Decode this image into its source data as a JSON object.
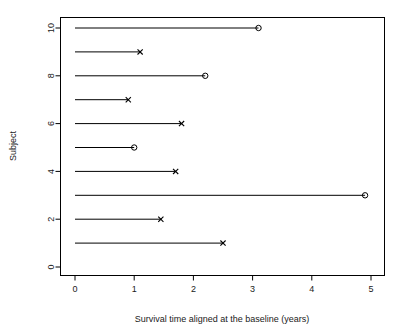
{
  "chart_data": {
    "type": "scatter",
    "title": "",
    "subtitle": "",
    "xlabel": "Survival time aligned at the baseline (years)",
    "ylabel": "Subject",
    "xlim": [
      0,
      5.2
    ],
    "ylim": [
      0,
      10.4
    ],
    "grid": false,
    "legend": null,
    "xticks": [
      "0",
      "1",
      "2",
      "3",
      "4",
      "5"
    ],
    "xtick_values": [
      0,
      1,
      2,
      3,
      4,
      5
    ],
    "yticks": [
      "0",
      "2",
      "4",
      "6",
      "8",
      "10"
    ],
    "ytick_values": [
      0,
      2,
      4,
      6,
      8,
      10
    ],
    "marker_semantics": {
      "circle": "censored",
      "x": "event"
    },
    "series": [
      {
        "name": "survival-segments",
        "points": [
          {
            "subject": 10,
            "start": 0,
            "time": 3.1,
            "marker": "circle",
            "status": "censored"
          },
          {
            "subject": 9,
            "start": 0,
            "time": 1.1,
            "marker": "x",
            "status": "event"
          },
          {
            "subject": 8,
            "start": 0,
            "time": 2.2,
            "marker": "circle",
            "status": "censored"
          },
          {
            "subject": 7,
            "start": 0,
            "time": 0.9,
            "marker": "x",
            "status": "event"
          },
          {
            "subject": 6,
            "start": 0,
            "time": 1.8,
            "marker": "x",
            "status": "event"
          },
          {
            "subject": 5,
            "start": 0,
            "time": 1.0,
            "marker": "circle",
            "status": "censored"
          },
          {
            "subject": 4,
            "start": 0,
            "time": 1.7,
            "marker": "x",
            "status": "event"
          },
          {
            "subject": 3,
            "start": 0,
            "time": 4.9,
            "marker": "circle",
            "status": "censored"
          },
          {
            "subject": 2,
            "start": 0,
            "time": 1.45,
            "marker": "x",
            "status": "event"
          },
          {
            "subject": 1,
            "start": 0,
            "time": 2.5,
            "marker": "x",
            "status": "event"
          }
        ]
      }
    ],
    "colors": {
      "line": "#000000",
      "marker": "#000000",
      "axis": "#000000",
      "background": "#ffffff"
    }
  }
}
